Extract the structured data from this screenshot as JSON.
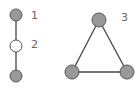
{
  "colors": {
    "node_filled": "#999999",
    "node_stroke": "#555555",
    "node_empty": "#ffffff",
    "edge": "#444444",
    "label": "#666666"
  },
  "graphs": [
    {
      "label": "1",
      "type": "single-node",
      "description": "top filled node connected by edge to node 2"
    },
    {
      "label": "2",
      "type": "path",
      "description": "unfilled node between two filled nodes"
    },
    {
      "label": "3",
      "type": "triangle",
      "description": "three filled nodes fully connected"
    }
  ],
  "labels": {
    "one": "1",
    "two": "2",
    "three": "3"
  }
}
